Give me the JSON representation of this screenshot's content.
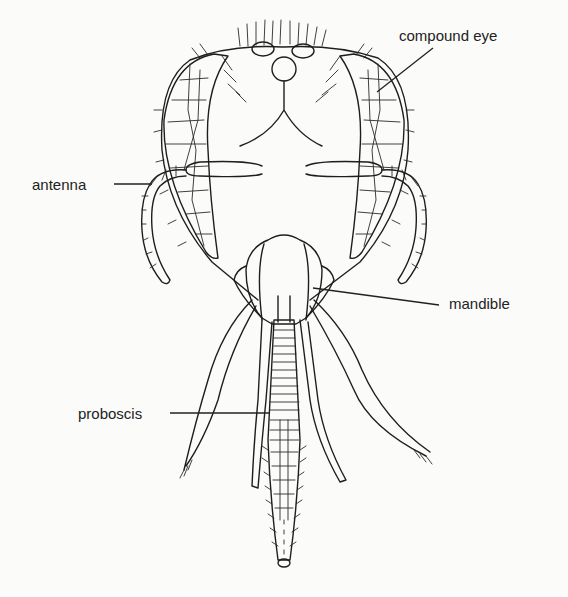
{
  "figure": {
    "background": "#fbfbfa",
    "ink": "#1e1e1e"
  },
  "labels": [
    {
      "id": "compound-eye",
      "text": "compound eye",
      "x": 399,
      "y": 28,
      "target": [
        377,
        92
      ],
      "line_start": [
        433,
        48
      ]
    },
    {
      "id": "antenna",
      "text": "antenna",
      "x": 32,
      "y": 177,
      "target": [
        152,
        184
      ],
      "line_start": [
        114,
        184
      ]
    },
    {
      "id": "mandible",
      "text": "mandible",
      "x": 449,
      "y": 296,
      "target": [
        313,
        288
      ],
      "line_start": [
        439,
        305
      ]
    },
    {
      "id": "proboscis",
      "text": "proboscis",
      "x": 78,
      "y": 406,
      "target": [
        268,
        413
      ],
      "line_start": [
        170,
        413
      ]
    }
  ],
  "colors": {
    "text": "#222222",
    "stipple": "#9a9a9a"
  }
}
